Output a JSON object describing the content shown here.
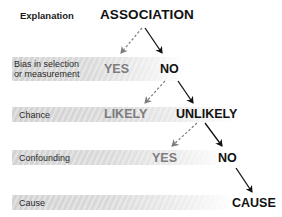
{
  "header": {
    "column_label": "Explanation",
    "root": "ASSOCIATION"
  },
  "rows": [
    {
      "label": "Bias in selection or measurement",
      "label_line1": "Bias in selection",
      "label_line2": "or measurement",
      "rejected": "YES",
      "accepted": "NO"
    },
    {
      "label": "Chance",
      "rejected": "LIKELY",
      "accepted": "UNLIKELY"
    },
    {
      "label": "Confounding",
      "rejected": "YES",
      "accepted": "NO"
    },
    {
      "label": "Cause",
      "accepted": "CAUSE"
    }
  ],
  "edges": [
    {
      "from": "ASSOCIATION",
      "to": "YES (bias)",
      "style": "dashed"
    },
    {
      "from": "ASSOCIATION",
      "to": "NO (bias)",
      "style": "solid"
    },
    {
      "from": "NO (bias)",
      "to": "LIKELY",
      "style": "dashed"
    },
    {
      "from": "NO (bias)",
      "to": "UNLIKELY",
      "style": "solid"
    },
    {
      "from": "UNLIKELY",
      "to": "YES (confounding)",
      "style": "dashed"
    },
    {
      "from": "UNLIKELY",
      "to": "NO (confounding)",
      "style": "solid"
    },
    {
      "from": "NO (confounding)",
      "to": "CAUSE",
      "style": "solid"
    }
  ],
  "colors": {
    "accepted": "#111111",
    "rejected": "#7d7d7d",
    "band": "#d2d2d2"
  }
}
